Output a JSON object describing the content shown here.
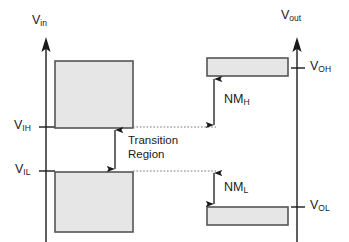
{
  "figure": {
    "type": "technical-diagram",
    "background_color": "#ffffff",
    "ink_color": "#1a1a1a",
    "box_fill_color": "#e6e6e6",
    "box_border_color": "#555555",
    "dotted_line_color": "#777777"
  },
  "axes": {
    "input_axis": {
      "label": "V",
      "label_sub": "in",
      "name": "v-in-axis",
      "x": 46,
      "top_y": 40,
      "bottom_y": 242,
      "arrow": "up"
    },
    "output_axis": {
      "label": "V",
      "label_sub": "out",
      "name": "v-out-axis",
      "x": 297,
      "top_y": 40,
      "bottom_y": 242,
      "arrow": "up"
    }
  },
  "input_side": {
    "ticks": [
      {
        "label": "V",
        "label_sub": "IH",
        "y": 127
      },
      {
        "label": "V",
        "label_sub": "IL",
        "y": 171
      }
    ],
    "high_box": {
      "x": 55,
      "y": 61,
      "w": 78,
      "h": 67
    },
    "low_box": {
      "x": 55,
      "y": 172,
      "w": 78,
      "h": 60
    }
  },
  "output_side": {
    "ticks": [
      {
        "label": "V",
        "label_sub": "OH",
        "y": 68
      },
      {
        "label": "V",
        "label_sub": "OL",
        "y": 207
      }
    ],
    "high_box": {
      "x": 207,
      "y": 58,
      "w": 81,
      "h": 18
    },
    "low_box": {
      "x": 207,
      "y": 207,
      "w": 81,
      "h": 18
    }
  },
  "annotations": {
    "transition_region": {
      "line1": "Transition",
      "line2": "Region",
      "arrow_x": 115,
      "arrow_top_y": 128,
      "arrow_bottom_y": 171
    },
    "noise_margin_high": {
      "label": "NM",
      "label_sub": "H",
      "arrow_x": 214,
      "arrow_top_y": 77,
      "arrow_bottom_y": 127
    },
    "noise_margin_low": {
      "label": "NM",
      "label_sub": "L",
      "arrow_x": 214,
      "arrow_top_y": 171,
      "arrow_bottom_y": 206
    }
  },
  "guides": {
    "upper_dotted": {
      "x1": 133,
      "x2": 214,
      "y": 127
    },
    "lower_dotted": {
      "x1": 133,
      "x2": 214,
      "y": 171
    }
  }
}
